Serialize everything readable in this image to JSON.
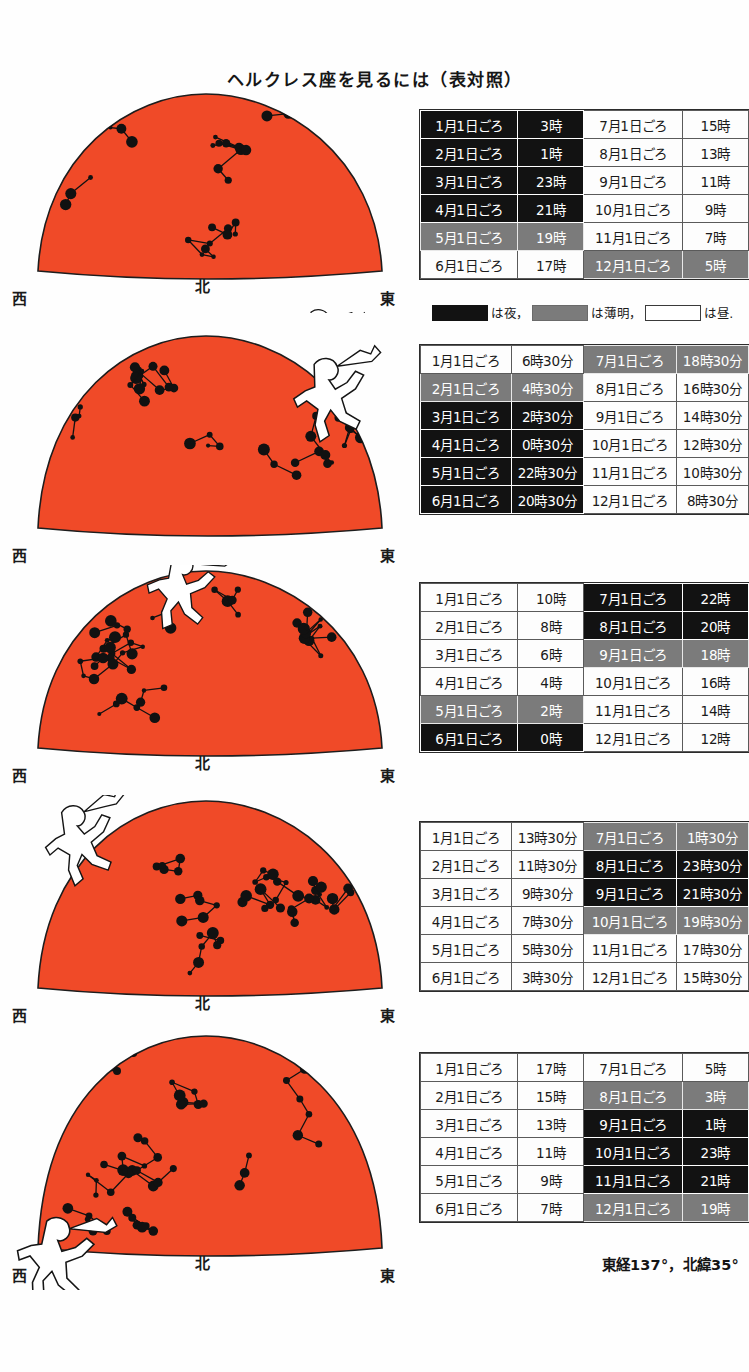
{
  "page": {
    "title": "ヘルクレス座を見るには（表対照）",
    "footer": "東経137°，北緯35°",
    "sky_color": "#F04A28",
    "night_color": "#121212",
    "twilight_color": "#7B7B7B",
    "day_color": "#FFFFFF"
  },
  "legend": {
    "night_label": "は夜，",
    "twilight_label": "は薄明，",
    "day_label": "は昼."
  },
  "directions": {
    "west": "西",
    "north": "北",
    "east": "東"
  },
  "panels": [
    {
      "name": "panel-1",
      "labels": {
        "west": "西",
        "north": "北",
        "east": "東"
      },
      "hercules_position": "east-horizon"
    },
    {
      "name": "panel-2",
      "labels": {
        "west": "西",
        "north": "",
        "east": "東"
      },
      "hercules_position": "northeast-high"
    },
    {
      "name": "panel-3",
      "labels": {
        "west": "西",
        "north": "北",
        "east": "東"
      },
      "hercules_position": "zenith-north"
    },
    {
      "name": "panel-4",
      "labels": {
        "west": "西",
        "north": "北",
        "east": "東"
      },
      "hercules_position": "northwest-high"
    },
    {
      "name": "panel-5",
      "labels": {
        "west": "西",
        "north": "北",
        "east": "東"
      },
      "hercules_position": "west-horizon"
    }
  ],
  "tables": [
    {
      "name": "table-1",
      "rows": [
        {
          "left_date": "1月1日ごろ",
          "left_time": "3時",
          "left_state": "night",
          "right_date": "7月1日ごろ",
          "right_time": "15時",
          "right_state": "day"
        },
        {
          "left_date": "2月1日ごろ",
          "left_time": "1時",
          "left_state": "night",
          "right_date": "8月1日ごろ",
          "right_time": "13時",
          "right_state": "day"
        },
        {
          "left_date": "3月1日ごろ",
          "left_time": "23時",
          "left_state": "night",
          "right_date": "9月1日ごろ",
          "right_time": "11時",
          "right_state": "day"
        },
        {
          "left_date": "4月1日ごろ",
          "left_time": "21時",
          "left_state": "night",
          "right_date": "10月1日ごろ",
          "right_time": "9時",
          "right_state": "day"
        },
        {
          "left_date": "5月1日ごろ",
          "left_time": "19時",
          "left_state": "twilight",
          "right_date": "11月1日ごろ",
          "right_time": "7時",
          "right_state": "day"
        },
        {
          "left_date": "6月1日ごろ",
          "left_time": "17時",
          "left_state": "day",
          "right_date": "12月1日ごろ",
          "right_time": "5時",
          "right_state": "twilight"
        }
      ]
    },
    {
      "name": "table-2",
      "rows": [
        {
          "left_date": "1月1日ごろ",
          "left_time": "6時30分",
          "left_state": "day",
          "right_date": "7月1日ごろ",
          "right_time": "18時30分",
          "right_state": "twilight"
        },
        {
          "left_date": "2月1日ごろ",
          "left_time": "4時30分",
          "left_state": "twilight",
          "right_date": "8月1日ごろ",
          "right_time": "16時30分",
          "right_state": "day"
        },
        {
          "left_date": "3月1日ごろ",
          "left_time": "2時30分",
          "left_state": "night",
          "right_date": "9月1日ごろ",
          "right_time": "14時30分",
          "right_state": "day"
        },
        {
          "left_date": "4月1日ごろ",
          "left_time": "0時30分",
          "left_state": "night",
          "right_date": "10月1日ごろ",
          "right_time": "12時30分",
          "right_state": "day"
        },
        {
          "left_date": "5月1日ごろ",
          "left_time": "22時30分",
          "left_state": "night",
          "right_date": "11月1日ごろ",
          "right_time": "10時30分",
          "right_state": "day"
        },
        {
          "left_date": "6月1日ごろ",
          "left_time": "20時30分",
          "left_state": "night",
          "right_date": "12月1日ごろ",
          "right_time": "8時30分",
          "right_state": "day"
        }
      ]
    },
    {
      "name": "table-3",
      "rows": [
        {
          "left_date": "1月1日ごろ",
          "left_time": "10時",
          "left_state": "day",
          "right_date": "7月1日ごろ",
          "right_time": "22時",
          "right_state": "night"
        },
        {
          "left_date": "2月1日ごろ",
          "left_time": "8時",
          "left_state": "day",
          "right_date": "8月1日ごろ",
          "right_time": "20時",
          "right_state": "night"
        },
        {
          "left_date": "3月1日ごろ",
          "left_time": "6時",
          "left_state": "day",
          "right_date": "9月1日ごろ",
          "right_time": "18時",
          "right_state": "twilight"
        },
        {
          "left_date": "4月1日ごろ",
          "left_time": "4時",
          "left_state": "day",
          "right_date": "10月1日ごろ",
          "right_time": "16時",
          "right_state": "day"
        },
        {
          "left_date": "5月1日ごろ",
          "left_time": "2時",
          "left_state": "twilight",
          "right_date": "11月1日ごろ",
          "right_time": "14時",
          "right_state": "day"
        },
        {
          "left_date": "6月1日ごろ",
          "left_time": "0時",
          "left_state": "night",
          "right_date": "12月1日ごろ",
          "right_time": "12時",
          "right_state": "day"
        }
      ]
    },
    {
      "name": "table-4",
      "rows": [
        {
          "left_date": "1月1日ごろ",
          "left_time": "13時30分",
          "left_state": "day",
          "right_date": "7月1日ごろ",
          "right_time": "1時30分",
          "right_state": "twilight"
        },
        {
          "left_date": "2月1日ごろ",
          "left_time": "11時30分",
          "left_state": "day",
          "right_date": "8月1日ごろ",
          "right_time": "23時30分",
          "right_state": "night"
        },
        {
          "left_date": "3月1日ごろ",
          "left_time": "9時30分",
          "left_state": "day",
          "right_date": "9月1日ごろ",
          "right_time": "21時30分",
          "right_state": "night"
        },
        {
          "left_date": "4月1日ごろ",
          "left_time": "7時30分",
          "left_state": "day",
          "right_date": "10月1日ごろ",
          "right_time": "19時30分",
          "right_state": "twilight"
        },
        {
          "left_date": "5月1日ごろ",
          "left_time": "5時30分",
          "left_state": "day",
          "right_date": "11月1日ごろ",
          "right_time": "17時30分",
          "right_state": "day"
        },
        {
          "left_date": "6月1日ごろ",
          "left_time": "3時30分",
          "left_state": "day",
          "right_date": "12月1日ごろ",
          "right_time": "15時30分",
          "right_state": "day"
        }
      ]
    },
    {
      "name": "table-5",
      "rows": [
        {
          "left_date": "1月1日ごろ",
          "left_time": "17時",
          "left_state": "day",
          "right_date": "7月1日ごろ",
          "right_time": "5時",
          "right_state": "day"
        },
        {
          "left_date": "2月1日ごろ",
          "left_time": "15時",
          "left_state": "day",
          "right_date": "8月1日ごろ",
          "right_time": "3時",
          "right_state": "twilight"
        },
        {
          "left_date": "3月1日ごろ",
          "left_time": "13時",
          "left_state": "day",
          "right_date": "9月1日ごろ",
          "right_time": "1時",
          "right_state": "night"
        },
        {
          "left_date": "4月1日ごろ",
          "left_time": "11時",
          "left_state": "day",
          "right_date": "10月1日ごろ",
          "right_time": "23時",
          "right_state": "night"
        },
        {
          "left_date": "5月1日ごろ",
          "left_time": "9時",
          "left_state": "day",
          "right_date": "11月1日ごろ",
          "right_time": "21時",
          "right_state": "night"
        },
        {
          "left_date": "6月1日ごろ",
          "left_time": "7時",
          "left_state": "day",
          "right_date": "12月1日ごろ",
          "right_time": "19時",
          "right_state": "twilight"
        }
      ]
    }
  ]
}
